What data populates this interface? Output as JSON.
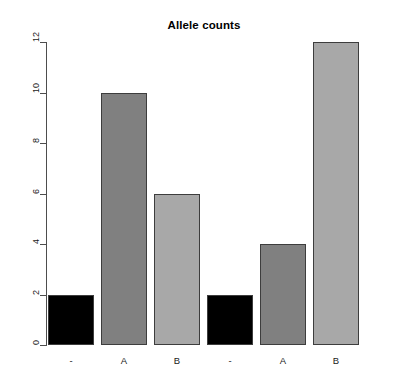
{
  "chart_data": {
    "type": "bar",
    "title": "Allele counts",
    "xlabel": "",
    "ylabel": "",
    "categories": [
      "-",
      "A",
      "B",
      "-",
      "A",
      "B"
    ],
    "values": [
      2,
      10,
      6,
      2,
      4,
      12
    ],
    "bar_colors": [
      "#000000",
      "#808080",
      "#a8a8a8",
      "#000000",
      "#808080",
      "#a8a8a8"
    ],
    "bar_border_color": "#3d3d3d",
    "ylim": [
      0,
      12
    ],
    "y_ticks": [
      0,
      2,
      4,
      6,
      8,
      10,
      12
    ],
    "y_tick_labels": [
      "0",
      "2",
      "4",
      "6",
      "8",
      "10",
      "12"
    ],
    "grid": false,
    "legend": null,
    "axis_color": "#4d4d4d",
    "background": "#ffffff"
  },
  "layout": {
    "plot_left": 46,
    "plot_right": 400,
    "plot_top": 42,
    "plot_bottom": 345,
    "bar_width": 46,
    "bar_gap": 7,
    "bar_start_x": 48
  }
}
